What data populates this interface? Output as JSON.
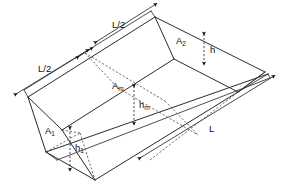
{
  "figure": {
    "background_color": "#ffffff",
    "line_color": "#2b2b2b",
    "dashed_color": "#4a4a4a",
    "width": 286,
    "height": 188
  },
  "labels": {
    "length_half_top": "L/2",
    "length_half_left": "L/2",
    "length_full": "L",
    "area_end_far": "A",
    "area_end_far_sub": "2",
    "area_mid": "A",
    "area_mid_sub": "m",
    "area_end_near": "A",
    "area_end_near_sub": "1",
    "depth_far": "h",
    "depth_mid": "h",
    "depth_mid_sub": "m",
    "depth_near": "h",
    "depth_near_sub": "1"
  },
  "annotations": [
    {
      "name": "length-half-top",
      "text": "L/2",
      "x": 117,
      "y": 24
    },
    {
      "name": "length-half-left",
      "text": "L/2",
      "x": 46,
      "y": 68
    },
    {
      "name": "length-full",
      "text": "L",
      "x": 212,
      "y": 128
    },
    {
      "name": "area-far-end",
      "text": "A",
      "sub": "2",
      "x": 180,
      "y": 40
    },
    {
      "name": "area-mid",
      "text": "A",
      "sub": "m",
      "x": 117,
      "y": 86
    },
    {
      "name": "area-near-end",
      "text": "A",
      "sub": "1",
      "x": 49,
      "y": 131
    },
    {
      "name": "depth-far-end",
      "text": "h",
      "sub": "",
      "x": 211,
      "y": 50
    },
    {
      "name": "depth-mid",
      "text": "h",
      "sub": "m",
      "x": 141,
      "y": 105
    },
    {
      "name": "depth-near-end",
      "text": "h",
      "sub": "1",
      "x": 77,
      "y": 148
    }
  ],
  "geometry": {
    "description": "Isometric trapezoidal channel of length L with three cross sections",
    "top_rim_far_vertex": [
      155,
      17
    ],
    "top_rim_left_vertex": [
      28,
      97
    ],
    "right_vertex": [
      265,
      72
    ],
    "bottom_near_vertex": [
      95,
      180
    ],
    "mid_station_marker": [
      85,
      53
    ],
    "sections": [
      "A1",
      "Am",
      "A2"
    ],
    "depths": [
      "h1",
      "hm",
      "h"
    ]
  },
  "dimensions": {
    "top_left_half": {
      "from": [
        95,
        40
      ],
      "to": [
        158,
        14
      ],
      "label": "L/2"
    },
    "left_lower_half": {
      "from": [
        26,
        86
      ],
      "to": [
        90,
        50
      ],
      "label": "L/2"
    },
    "full_length": {
      "from": [
        140,
        156
      ],
      "to": [
        266,
        76
      ],
      "label": "L"
    },
    "depth_far": {
      "from": [
        206,
        36
      ],
      "to": [
        206,
        63
      ],
      "label": "h"
    },
    "depth_mid": {
      "from": [
        136,
        88
      ],
      "to": [
        136,
        122
      ],
      "label": "hm"
    },
    "depth_near": {
      "from": [
        72,
        130
      ],
      "to": [
        72,
        168
      ],
      "label": "h1"
    }
  }
}
